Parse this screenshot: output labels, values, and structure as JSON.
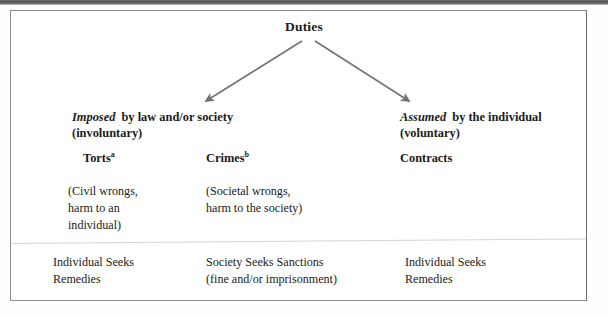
{
  "figure": {
    "title": "Duties",
    "arrow_color": "#6f7276",
    "frame_color": "#8b8b8d",
    "branches": [
      {
        "id": "imposed",
        "keyword": "Imposed",
        "rest": " by law and/or society",
        "qualifier": "(involuntary)"
      },
      {
        "id": "assumed",
        "keyword": "Assumed",
        "rest": " by the individual",
        "qualifier": "(voluntary)"
      }
    ],
    "columns": [
      {
        "id": "torts",
        "heading": "Torts",
        "footnote_marker": "a",
        "description": "(Civil wrongs,\nharm to an\nindividual)",
        "outcome": "Individual Seeks\nRemedies"
      },
      {
        "id": "crimes",
        "heading": "Crimes",
        "footnote_marker": "b",
        "description": "(Societal wrongs,\nharm to the society)",
        "outcome": "Society Seeks Sanctions\n(fine and/or imprisonment)"
      },
      {
        "id": "contracts",
        "heading": "Contracts",
        "footnote_marker": "",
        "description": "",
        "outcome": "Individual Seeks\nRemedies"
      }
    ]
  }
}
